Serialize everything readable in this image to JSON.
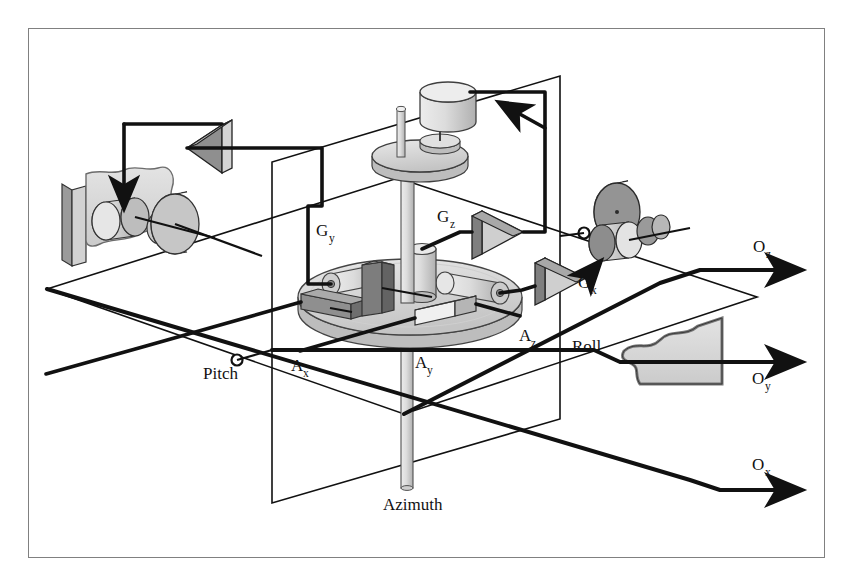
{
  "figure": {
    "background_color": "#ffffff",
    "frame_color": "#808080",
    "ink_color": "#111111"
  },
  "palette": {
    "light_gray": "#d9d9d9",
    "mid_gray": "#b9b9b9",
    "dark_gray": "#8a8a8a",
    "darker_gray": "#6f6f6f",
    "amp_fill": "#9a9a9a",
    "outline": "#111111"
  },
  "labels": {
    "gyro_y": {
      "base": "G",
      "sub": "y",
      "x": 316,
      "y": 236
    },
    "gyro_z": {
      "base": "G",
      "sub": "z",
      "x": 437,
      "y": 222
    },
    "gyro_x": {
      "base": "G",
      "sub": "x",
      "x": 578,
      "y": 288
    },
    "accel_x": {
      "base": "A",
      "sub": "x",
      "x": 291,
      "y": 371
    },
    "accel_y": {
      "base": "A",
      "sub": "y",
      "x": 415,
      "y": 368
    },
    "accel_z": {
      "base": "A",
      "sub": "z",
      "x": 519,
      "y": 341
    },
    "out_z": {
      "base": "O",
      "sub": "z",
      "x": 753,
      "y": 252
    },
    "out_y": {
      "base": "O",
      "sub": "y",
      "x": 752,
      "y": 384
    },
    "out_x": {
      "base": "O",
      "sub": "x",
      "x": 752,
      "y": 470
    },
    "pitch": {
      "text": "Pitch",
      "x": 203,
      "y": 379
    },
    "roll": {
      "text": "Roll",
      "x": 572,
      "y": 352
    },
    "azimuth": {
      "text": "Azimuth",
      "x": 383,
      "y": 510
    }
  },
  "axes": [
    {
      "name": "O_z",
      "label_key": "out_z"
    },
    {
      "name": "O_y",
      "label_key": "out_y"
    },
    {
      "name": "O_x",
      "label_key": "out_x"
    }
  ],
  "platform": {
    "gyros": [
      "G_y",
      "G_z",
      "G_x"
    ],
    "accelerometers": [
      "A_x",
      "A_y",
      "A_z"
    ],
    "gimbal_axes": [
      "Pitch",
      "Roll",
      "Azimuth"
    ]
  },
  "components": {
    "amplifier_count": 3,
    "motor_cluster_left": "pitch-actuator-cluster",
    "motor_cluster_right": "roll-actuator-cluster",
    "motor_top": "azimuth-actuator"
  }
}
